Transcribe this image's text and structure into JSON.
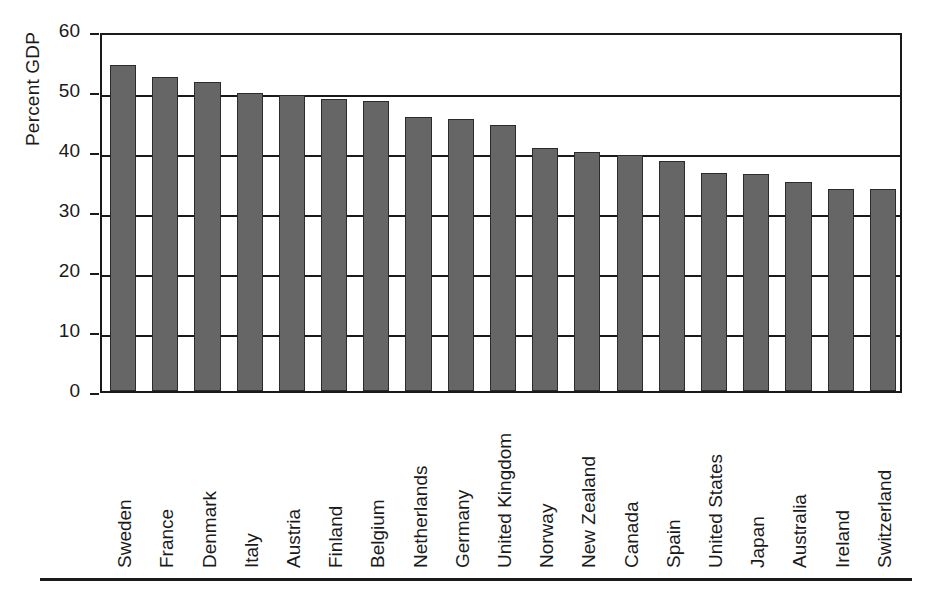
{
  "chart_data": {
    "type": "bar",
    "title": "",
    "subtitle": "",
    "xlabel": "",
    "ylabel": "Percent GDP",
    "ylim": [
      0,
      60
    ],
    "yticks": [
      0,
      10,
      20,
      30,
      40,
      50,
      60
    ],
    "ytick_labels": [
      "0",
      "10",
      "20",
      "30",
      "40",
      "50",
      "60"
    ],
    "grid": true,
    "grid_axis": "y",
    "legend": null,
    "legend_position": "none",
    "bar_color": "#666666",
    "bar_edge_color": "#2b2b2b",
    "axis_color": "#1a1a1a",
    "background_color": "#ffffff",
    "categories": [
      "Sweden",
      "France",
      "Denmark",
      "Italy",
      "Austria",
      "Finland",
      "Belgium",
      "Netherlands",
      "Germany",
      "United Kingdom",
      "Norway",
      "New Zealand",
      "Canada",
      "Spain",
      "United States",
      "Japan",
      "Australia",
      "Ireland",
      "Switzerland"
    ],
    "values": [
      54.4,
      52.4,
      51.5,
      49.7,
      49.4,
      48.7,
      48.4,
      45.6,
      45.3,
      44.3,
      40.5,
      39.8,
      39.4,
      38.4,
      36.4,
      36.1,
      34.8,
      33.7,
      33.6
    ]
  }
}
